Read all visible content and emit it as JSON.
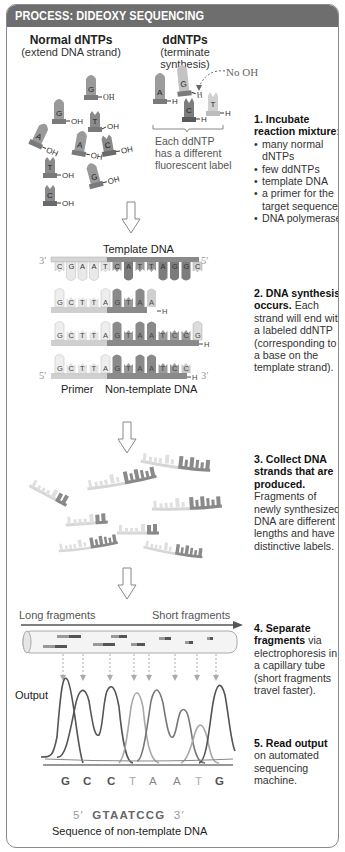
{
  "header": {
    "title": "PROCESS: DIDEOXY SEQUENCING",
    "bg_color": "#6e6e6e"
  },
  "reagents": {
    "normal": {
      "title": "Normal dNTPs",
      "subtitle": "(extend DNA strand)",
      "nucleotides": [
        {
          "base": "G",
          "group": "OH"
        },
        {
          "base": "G",
          "group": "OH"
        },
        {
          "base": "T",
          "group": "OH"
        },
        {
          "base": "A",
          "group": "OH"
        },
        {
          "base": "A",
          "group": "OH"
        },
        {
          "base": "C",
          "group": "OH"
        },
        {
          "base": "T",
          "group": "OH"
        },
        {
          "base": "G",
          "group": "OH"
        },
        {
          "base": "C",
          "group": "OH"
        }
      ]
    },
    "dd": {
      "title": "ddNTPs",
      "subtitle": "(terminate synthesis)",
      "no_oh_label": "No OH",
      "nucleotides": [
        {
          "base": "A",
          "group": "H"
        },
        {
          "base": "G",
          "group": "H"
        },
        {
          "base": "C",
          "group": "H"
        },
        {
          "base": "T",
          "group": "H"
        }
      ],
      "caption": [
        "Each ddNTP",
        "has a different",
        "fluorescent label"
      ]
    }
  },
  "steps": [
    {
      "num_title": "1. Incubate reaction mixture:",
      "body": "",
      "bullets": [
        "many normal dNTPs",
        "few ddNTPs",
        "template DNA",
        "a primer for the target sequence",
        "DNA polymerase"
      ]
    },
    {
      "num_title": "2. DNA synthesis occurs.",
      "body": "Each strand will end with a labeled ddNTP (corresponding to a base on the template strand)."
    },
    {
      "num_title": "3. Collect DNA strands that are produced.",
      "body": "Fragments of newly synthesized DNA are different lengths and have distinctive labels."
    },
    {
      "num_title": "4. Separate fragments",
      "body": "via electrophoresis in a capillary tube (short fragments travel faster)."
    },
    {
      "num_title": "5. Read output",
      "body": "on automated sequencing machine."
    }
  ],
  "synthesis": {
    "template_label": "Template DNA",
    "template_left_end": "3′",
    "template_right_end": "5′",
    "template_bases": [
      "C",
      "G",
      "A",
      "A",
      "T",
      "C",
      "A",
      "T",
      "T",
      "A",
      "G",
      "G",
      "C"
    ],
    "strands": [
      {
        "bases": [
          "G",
          "C",
          "T",
          "T",
          "A",
          "G",
          "T",
          "A",
          "A"
        ],
        "end": "H"
      },
      {
        "bases": [
          "G",
          "C",
          "T",
          "T",
          "A",
          "G",
          "T",
          "A",
          "A",
          "T",
          "C",
          "C",
          "G"
        ],
        "end": "H"
      },
      {
        "bases": [
          "G",
          "C",
          "T",
          "T",
          "A",
          "G",
          "T",
          "A",
          "A",
          "T",
          "C",
          "C"
        ],
        "end": "H"
      }
    ],
    "bottom_left_end": "5′",
    "bottom_right_end": "3′",
    "primer_label": "Primer",
    "nontemplate_label": "Non-template DNA"
  },
  "electrophoresis": {
    "long_label": "Long fragments",
    "short_label": "Short fragments"
  },
  "output": {
    "label": "Output",
    "bases": [
      "G",
      "C",
      "C",
      "T",
      "A",
      "A",
      "T",
      "G"
    ],
    "sequence_5": "5′",
    "sequence": "GTAATCCG",
    "sequence_3": "3′",
    "sequence_caption": "Sequence of non-template DNA"
  },
  "colors": {
    "light_strand": "#c9c9c9",
    "dark_strand": "#8a8a8a",
    "G": "#6a6a6a",
    "C": "#4a4a4a",
    "T": "#a8a8a8",
    "A": "#8c8c8c"
  }
}
